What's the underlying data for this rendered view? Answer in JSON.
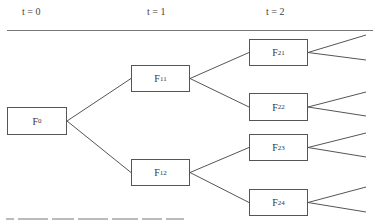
{
  "header": {
    "periods": [
      {
        "label": "t = 0",
        "x": 22
      },
      {
        "label": "t = 1",
        "x": 147
      },
      {
        "label": "t = 2",
        "x": 266
      }
    ]
  },
  "nodes": [
    {
      "id": "F0",
      "base": "F",
      "sub": "0",
      "x": 7,
      "y": 107,
      "w": 60,
      "h": 28
    },
    {
      "id": "F11",
      "base": "F",
      "sub": "11",
      "x": 131,
      "y": 65,
      "w": 59,
      "h": 27
    },
    {
      "id": "F12",
      "base": "F",
      "sub": "12",
      "x": 131,
      "y": 159,
      "w": 59,
      "h": 27
    },
    {
      "id": "F21",
      "base": "F",
      "sub": "21",
      "x": 249,
      "y": 39,
      "w": 59,
      "h": 27
    },
    {
      "id": "F22",
      "base": "F",
      "sub": "22",
      "x": 249,
      "y": 93,
      "w": 59,
      "h": 28
    },
    {
      "id": "F23",
      "base": "F",
      "sub": "23",
      "x": 249,
      "y": 134,
      "w": 59,
      "h": 27
    },
    {
      "id": "F24",
      "base": "F",
      "sub": "24",
      "x": 249,
      "y": 189,
      "w": 59,
      "h": 27
    }
  ],
  "edges": [
    {
      "from": "F0",
      "to": "F11"
    },
    {
      "from": "F0",
      "to": "F12"
    },
    {
      "from": "F11",
      "to": "F21"
    },
    {
      "from": "F11",
      "to": "F22"
    },
    {
      "from": "F12",
      "to": "F23"
    },
    {
      "from": "F12",
      "to": "F24"
    }
  ],
  "open_branches": [
    {
      "from": "F21",
      "to_y": 35
    },
    {
      "from": "F21",
      "to_y": 60
    },
    {
      "from": "F22",
      "to_y": 92
    },
    {
      "from": "F22",
      "to_y": 116
    },
    {
      "from": "F23",
      "to_y": 133
    },
    {
      "from": "F23",
      "to_y": 157
    },
    {
      "from": "F24",
      "to_y": 187
    },
    {
      "from": "F24",
      "to_y": 212
    }
  ],
  "colors": {
    "line": "#555555",
    "rule": "#777777"
  }
}
